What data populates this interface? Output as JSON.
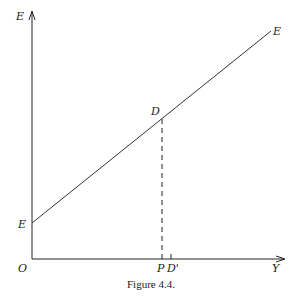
{
  "figure": {
    "caption": "Figure 4.4.",
    "axes": {
      "y_label": "E",
      "x_label": "Y",
      "origin_label": "O"
    },
    "line": {
      "intercept_label": "E",
      "end_label": "E"
    },
    "points": {
      "D_label": "D",
      "P_label": "P",
      "D_prime_label": "D'"
    },
    "colors": {
      "ink": "#222222",
      "background": "#ffffff"
    }
  }
}
